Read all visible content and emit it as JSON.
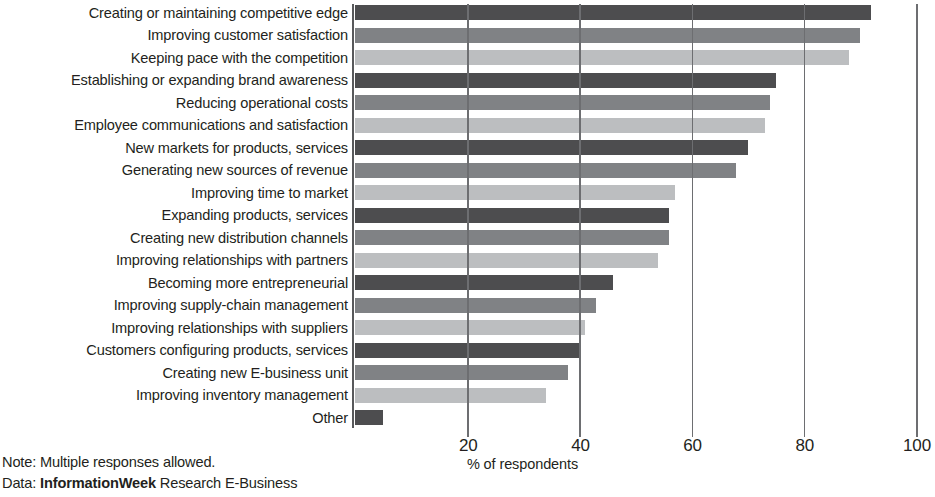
{
  "chart_data": {
    "type": "bar",
    "orientation": "horizontal",
    "title": "",
    "xlabel": "% of respondents",
    "ylabel": "",
    "xlim": [
      0,
      100
    ],
    "xticks": [
      20,
      40,
      60,
      80,
      100
    ],
    "xtick_labels": [
      "20",
      "40",
      "60",
      "80",
      "100"
    ],
    "grid": "vertical",
    "legend": "none",
    "categories": [
      "Creating or maintaining competitive edge",
      "Improving customer satisfaction",
      "Keeping pace with the competition",
      "Establishing or expanding brand awareness",
      "Reducing operational costs",
      "Employee communications and satisfaction",
      "New markets for products, services",
      "Generating new sources of revenue",
      "Improving time to market",
      "Expanding products, services",
      "Creating new distribution channels",
      "Improving relationships with partners",
      "Becoming more entrepreneurial",
      "Improving supply-chain management",
      "Improving relationships with suppliers",
      "Customers configuring products, services",
      "Creating new E-business unit",
      "Improving inventory management",
      "Other"
    ],
    "values": [
      92,
      90,
      88,
      75,
      74,
      73,
      70,
      68,
      57,
      56,
      56,
      54,
      46,
      43,
      41,
      40,
      38,
      34,
      5
    ],
    "bar_colors": [
      "#4d4d4f",
      "#808285",
      "#bcbec0",
      "#4d4d4f",
      "#808285",
      "#bcbec0",
      "#4d4d4f",
      "#808285",
      "#bcbec0",
      "#4d4d4f",
      "#808285",
      "#bcbec0",
      "#4d4d4f",
      "#808285",
      "#bcbec0",
      "#4d4d4f",
      "#808285",
      "#bcbec0",
      "#4d4d4f"
    ]
  },
  "footer": {
    "note_line": "Note: Multiple responses allowed.",
    "data_prefix": "Data: ",
    "data_brand": "InformationWeek",
    "data_suffix": " Research E-Business"
  }
}
